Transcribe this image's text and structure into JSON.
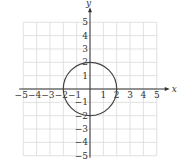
{
  "chart_data": {
    "type": "line",
    "title": "",
    "xlabel": "x",
    "ylabel": "y",
    "xlim": [
      -5,
      5
    ],
    "ylim": [
      -5,
      5
    ],
    "grid": true,
    "x_ticks": [
      "-5",
      "-4",
      "-3",
      "-2",
      "-1",
      "1",
      "2",
      "3",
      "4",
      "5"
    ],
    "y_ticks": [
      "5",
      "4",
      "3",
      "2",
      "1",
      "-1",
      "-2",
      "-3",
      "-4",
      "-5"
    ],
    "series": [
      {
        "name": "circle",
        "equation": "x^2 + y^2 = 4",
        "center": [
          0,
          0
        ],
        "radius": 2,
        "key_points": [
          [
            2,
            0
          ],
          [
            0,
            2
          ],
          [
            -2,
            0
          ],
          [
            0,
            -2
          ]
        ]
      }
    ],
    "colors": {
      "grid": "#d9d9d9",
      "axis": "#333333",
      "curve": "#444444"
    }
  }
}
